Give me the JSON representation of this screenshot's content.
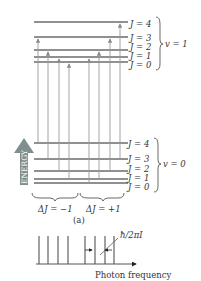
{
  "upper_band": {
    "label": "v = 1",
    "levels": [
      "J = 4",
      "J = 3",
      "J = 2",
      "J = 1",
      "J = 0"
    ]
  },
  "lower_band": {
    "label": "v = 0",
    "levels": [
      "J = 4",
      "J = 3",
      "J = 2",
      "J = 1",
      "J = 0"
    ]
  },
  "energy_axis_label": "ENERGY",
  "branches": [
    {
      "label": "ΔJ = −1",
      "transitions": [
        {
          "from_J": 4,
          "to_J": 3
        },
        {
          "from_J": 3,
          "to_J": 2
        },
        {
          "from_J": 2,
          "to_J": 1
        },
        {
          "from_J": 1,
          "to_J": 0
        }
      ]
    },
    {
      "label": "ΔJ = +1",
      "transitions": [
        {
          "from_J": 0,
          "to_J": 1
        },
        {
          "from_J": 1,
          "to_J": 2
        },
        {
          "from_J": 2,
          "to_J": 3
        },
        {
          "from_J": 3,
          "to_J": 4
        }
      ]
    }
  ],
  "panel_label": "(a)",
  "spectrum": {
    "line_count": 8,
    "spacing_label": "ħ/2πI",
    "xlabel": "Photon frequency"
  },
  "colors": {
    "level_line": "#222222",
    "transition_arrow": "#9a9a9a",
    "energy_arrow": "#7a8a8a",
    "text": "#333333"
  }
}
